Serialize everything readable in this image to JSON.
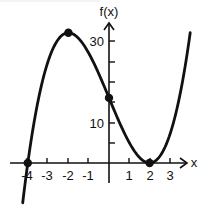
{
  "chart_data": {
    "type": "line",
    "title": "",
    "xlabel": "x",
    "ylabel": "f(x)",
    "function": "f(x) = (x + 4)(x - 2)^2",
    "xlim": [
      -4.3,
      4.0
    ],
    "ylim": [
      -10,
      32
    ],
    "x_ticks": [
      -4,
      -3,
      -2,
      -1,
      1,
      2,
      3
    ],
    "x_tick_labels": [
      "-4",
      "-3",
      "-2",
      "-1",
      "1",
      "2",
      "3"
    ],
    "y_ticks": [
      5,
      10,
      15,
      20,
      25,
      30
    ],
    "y_tick_labels": [
      {
        "value": 10,
        "text": "10"
      },
      {
        "value": 30,
        "text": "30"
      }
    ],
    "marked_points": [
      {
        "x": -4,
        "y": 0,
        "label": "x-intercept"
      },
      {
        "x": -2,
        "y": 32,
        "label": "local maximum"
      },
      {
        "x": 0,
        "y": 16,
        "label": "y-intercept"
      },
      {
        "x": 2,
        "y": 0,
        "label": "local minimum / x-intercept"
      }
    ],
    "series": [
      {
        "name": "f(x)",
        "x": [
          -4.25,
          -4,
          -3.5,
          -3,
          -2.5,
          -2,
          -1.5,
          -1,
          -0.5,
          0,
          0.5,
          1,
          1.5,
          2,
          2.5,
          3,
          3.5,
          4
        ],
        "values": [
          -9.6,
          0,
          15.1,
          25,
          30.4,
          32,
          30.6,
          27,
          21.9,
          16,
          10.1,
          5,
          1.4,
          0,
          1.6,
          7,
          16.9,
          32
        ]
      }
    ],
    "grid": false,
    "legend": "none"
  },
  "labels": {
    "y_axis": "f(x)",
    "x_axis": "x",
    "y30": "30",
    "y10": "10",
    "xm4": "-4",
    "xm3": "-3",
    "xm2": "-2",
    "xm1": "-1",
    "x1": "1",
    "x2": "2",
    "x3": "3"
  }
}
